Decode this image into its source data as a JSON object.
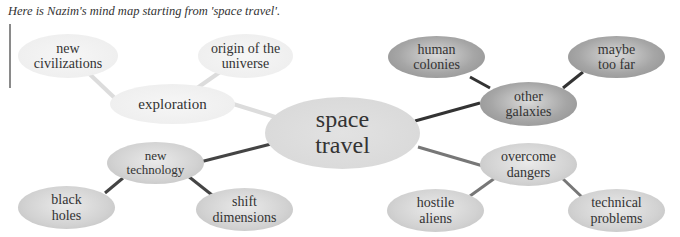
{
  "caption": "Here is Nazim's mind map starting from 'space travel'.",
  "center": {
    "label": "space travel",
    "line1": "space",
    "line2": "travel"
  },
  "branches": [
    {
      "label": "exploration",
      "line1": "exploration",
      "line2": "",
      "children": [
        {
          "line1": "new",
          "line2": "civilizations"
        },
        {
          "line1": "origin of the",
          "line2": "universe"
        }
      ]
    },
    {
      "label": "other galaxies",
      "line1": "other",
      "line2": "galaxies",
      "children": [
        {
          "line1": "human",
          "line2": "colonies"
        },
        {
          "line1": "maybe",
          "line2": "too far"
        }
      ]
    },
    {
      "label": "new technology",
      "line1": "new",
      "line2": "technology",
      "children": [
        {
          "line1": "black",
          "line2": "holes"
        },
        {
          "line1": "shift",
          "line2": "dimensions"
        }
      ]
    },
    {
      "label": "overcome dangers",
      "line1": "overcome",
      "line2": "dangers",
      "children": [
        {
          "line1": "hostile",
          "line2": "aliens"
        },
        {
          "line1": "technical",
          "line2": "problems"
        }
      ]
    }
  ],
  "colors": {
    "pale": "#efefef",
    "light": "#cfcfcf",
    "dark": "#a0a0a0",
    "line_pale": "#dcdcdc",
    "line_dark": "#333333",
    "line_mid": "#777777"
  }
}
